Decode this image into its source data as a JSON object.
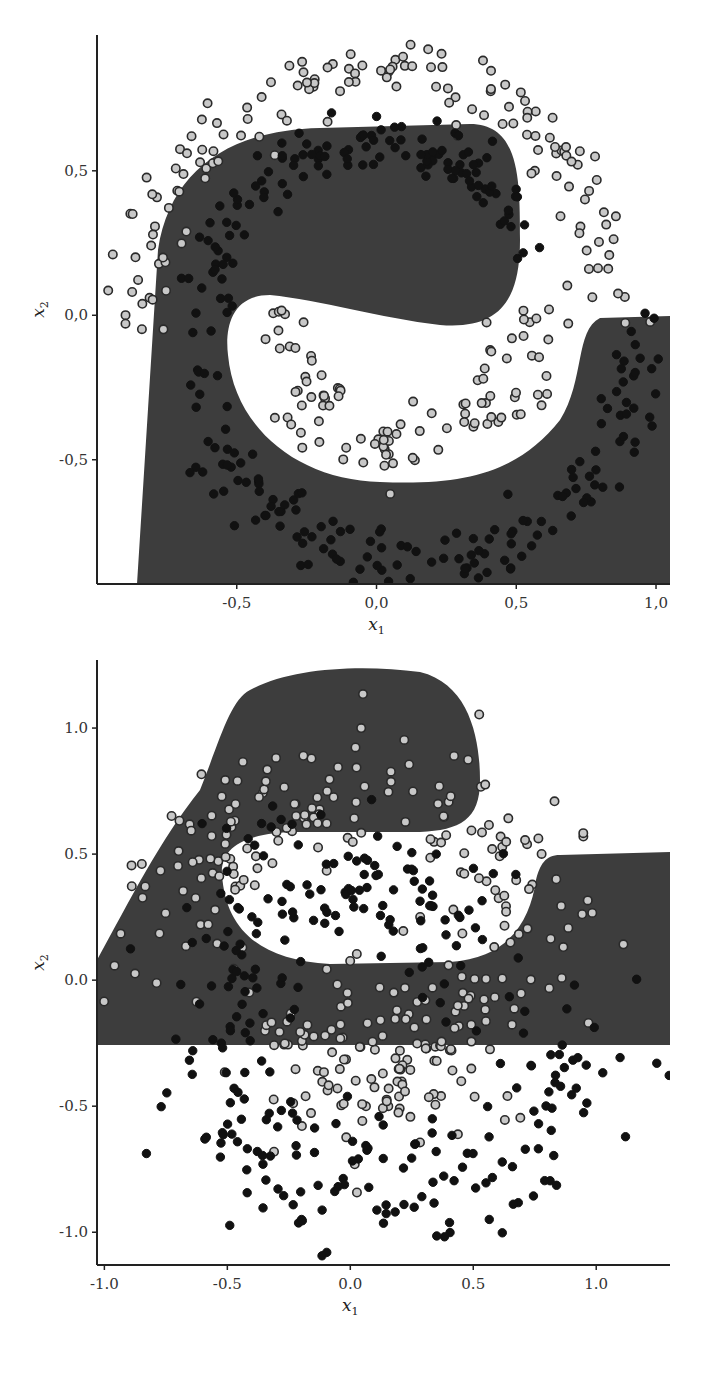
{
  "chart_data": [
    {
      "type": "scatter",
      "title": "",
      "subtitle": "Two-moons classification with decision region (clean data)",
      "xlabel": "x1",
      "ylabel": "x2",
      "xlim": [
        -1.0,
        1.05
      ],
      "ylim": [
        -0.93,
        0.97
      ],
      "xticks": [
        -0.5,
        0.0,
        0.5,
        1.0
      ],
      "xtick_labels": [
        "-0,5",
        "0,0",
        "0,5",
        "1,0"
      ],
      "yticks": [
        -0.5,
        0.0,
        0.5
      ],
      "ytick_labels": [
        "-0,5",
        "0,0",
        "0,5"
      ],
      "grid": false,
      "legend": null,
      "region_colors": {
        "class_dark": "#3d3d3d",
        "class_light": "#ffffff"
      },
      "series": [
        {
          "name": "outer moon (light markers)",
          "marker": "open-circle",
          "fill": "#c8c8c8",
          "edge": "#2a2a2a",
          "shape": "arc",
          "center": [
            0.0,
            0.0
          ],
          "radius": 0.85,
          "angle_range_deg": [
            0,
            180
          ],
          "noise": 0.06,
          "count": 150
        },
        {
          "name": "inner arc light (light markers)",
          "marker": "open-circle",
          "fill": "#c8c8c8",
          "edge": "#2a2a2a",
          "shape": "arc",
          "center": [
            0.1,
            0.0
          ],
          "radius": 0.45,
          "angle_range_deg": [
            180,
            360
          ],
          "noise": 0.06,
          "count": 100
        },
        {
          "name": "outer moon inner band (dark markers)",
          "marker": "filled-circle",
          "fill": "#111111",
          "edge": "#111111",
          "shape": "arc",
          "center": [
            0.0,
            0.0
          ],
          "radius": 0.6,
          "angle_range_deg": [
            20,
            180
          ],
          "noise": 0.05,
          "count": 130
        },
        {
          "name": "lower arc (dark markers)",
          "marker": "filled-circle",
          "fill": "#111111",
          "edge": "#111111",
          "shape": "arc",
          "center": [
            0.15,
            -0.05
          ],
          "radius": 0.8,
          "angle_range_deg": [
            190,
            360
          ],
          "noise": 0.06,
          "count": 150
        }
      ]
    },
    {
      "type": "scatter",
      "title": "",
      "subtitle": "Two-moons classification with decision region (noisy data)",
      "xlabel": "x1",
      "ylabel": "x2",
      "xlim": [
        -1.03,
        1.3
      ],
      "ylim": [
        -1.13,
        1.27
      ],
      "xticks": [
        -1.0,
        -0.5,
        0.0,
        0.5,
        1.0
      ],
      "xtick_labels": [
        "-1.0",
        "-0.5",
        "0.0",
        "0.5",
        "1.0"
      ],
      "yticks": [
        -1.0,
        -0.5,
        0.0,
        0.5,
        1.0
      ],
      "ytick_labels": [
        "-1.0",
        "-0.5",
        "0.0",
        "0.5",
        "1.0"
      ],
      "grid": false,
      "legend": null,
      "region_colors": {
        "class_dark": "#3d3d3d",
        "class_light": "#ffffff"
      },
      "series": [
        {
          "name": "upper scatter (light markers)",
          "marker": "open-circle",
          "fill": "#c8c8c8",
          "edge": "#2a2a2a",
          "shape": "arc",
          "center": [
            0.0,
            0.0
          ],
          "radius": 0.75,
          "angle_range_deg": [
            0,
            180
          ],
          "noise": 0.16,
          "count": 180
        },
        {
          "name": "inner blob (light markers)",
          "marker": "open-circle",
          "fill": "#c8c8c8",
          "edge": "#2a2a2a",
          "shape": "arc",
          "center": [
            0.15,
            -0.1
          ],
          "radius": 0.3,
          "angle_range_deg": [
            180,
            360
          ],
          "noise": 0.16,
          "count": 150
        },
        {
          "name": "upper band (dark markers)",
          "marker": "filled-circle",
          "fill": "#111111",
          "edge": "#111111",
          "shape": "arc",
          "center": [
            0.0,
            0.0
          ],
          "radius": 0.45,
          "angle_range_deg": [
            10,
            180
          ],
          "noise": 0.15,
          "count": 130
        },
        {
          "name": "lower arc (dark markers)",
          "marker": "filled-circle",
          "fill": "#111111",
          "edge": "#111111",
          "shape": "arc",
          "center": [
            0.15,
            -0.1
          ],
          "radius": 0.75,
          "angle_range_deg": [
            180,
            360
          ],
          "noise": 0.15,
          "count": 170
        }
      ]
    }
  ],
  "panels": {
    "top": {
      "xlabel": "x",
      "xlabel_sub": "1",
      "ylabel": "x",
      "ylabel_sub": "2"
    },
    "bottom": {
      "xlabel": "x",
      "xlabel_sub": "1",
      "ylabel": "x",
      "ylabel_sub": "2"
    }
  }
}
